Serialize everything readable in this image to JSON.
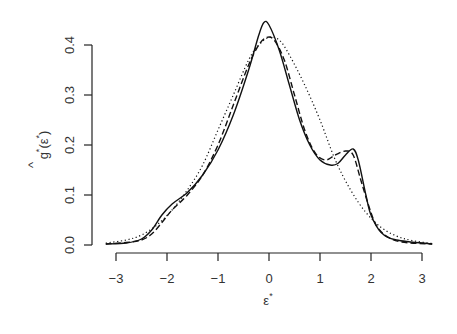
{
  "chart_data": {
    "type": "line",
    "title": "",
    "xlabel": "ε*",
    "ylabel": "ĝ*(ε*)",
    "xlim": [
      -3.2,
      3.2
    ],
    "ylim": [
      0.0,
      0.45
    ],
    "x_ticks": [
      -3,
      -2,
      -1,
      0,
      1,
      2,
      3
    ],
    "x_tick_labels": [
      "-3",
      "-2",
      "-1",
      "0",
      "1",
      "2",
      "3"
    ],
    "y_ticks": [
      0.0,
      0.1,
      0.2,
      0.3,
      0.4
    ],
    "y_tick_labels": [
      "0.0",
      "0.1",
      "0.2",
      "0.3",
      "0.4"
    ],
    "grid": false,
    "legend": null,
    "series": [
      {
        "name": "solid",
        "line_style": "solid",
        "x": [
          -3.2,
          -2.8,
          -2.5,
          -2.3,
          -2.1,
          -1.9,
          -1.6,
          -1.3,
          -1.0,
          -0.7,
          -0.4,
          -0.2,
          -0.1,
          0.0,
          0.2,
          0.4,
          0.6,
          0.8,
          1.0,
          1.2,
          1.35,
          1.5,
          1.65,
          1.75,
          1.9,
          2.0,
          2.2,
          2.5,
          3.2
        ],
        "y": [
          0.002,
          0.004,
          0.012,
          0.03,
          0.06,
          0.082,
          0.105,
          0.14,
          0.19,
          0.26,
          0.35,
          0.42,
          0.445,
          0.44,
          0.39,
          0.32,
          0.25,
          0.2,
          0.17,
          0.16,
          0.163,
          0.18,
          0.192,
          0.17,
          0.1,
          0.06,
          0.025,
          0.01,
          0.002
        ]
      },
      {
        "name": "dashed",
        "line_style": "dashed",
        "x": [
          -3.2,
          -2.8,
          -2.5,
          -2.3,
          -2.1,
          -1.9,
          -1.6,
          -1.3,
          -1.0,
          -0.7,
          -0.4,
          -0.2,
          -0.05,
          0.1,
          0.3,
          0.5,
          0.7,
          0.9,
          1.1,
          1.3,
          1.5,
          1.65,
          1.8,
          1.95,
          2.1,
          2.3,
          2.6,
          3.2
        ],
        "y": [
          0.002,
          0.005,
          0.01,
          0.022,
          0.045,
          0.07,
          0.1,
          0.14,
          0.2,
          0.28,
          0.36,
          0.4,
          0.415,
          0.41,
          0.37,
          0.3,
          0.23,
          0.185,
          0.17,
          0.18,
          0.188,
          0.18,
          0.13,
          0.08,
          0.04,
          0.018,
          0.006,
          0.002
        ]
      },
      {
        "name": "dotted",
        "line_style": "dotted",
        "x": [
          -3.2,
          -2.8,
          -2.5,
          -2.2,
          -1.9,
          -1.6,
          -1.3,
          -1.0,
          -0.7,
          -0.4,
          -0.2,
          0.0,
          0.2,
          0.4,
          0.7,
          1.0,
          1.3,
          1.6,
          1.9,
          2.2,
          2.5,
          2.8,
          3.2
        ],
        "y": [
          0.004,
          0.01,
          0.02,
          0.04,
          0.07,
          0.11,
          0.16,
          0.23,
          0.3,
          0.37,
          0.4,
          0.415,
          0.41,
          0.38,
          0.32,
          0.25,
          0.17,
          0.11,
          0.065,
          0.035,
          0.018,
          0.009,
          0.003
        ]
      }
    ]
  }
}
